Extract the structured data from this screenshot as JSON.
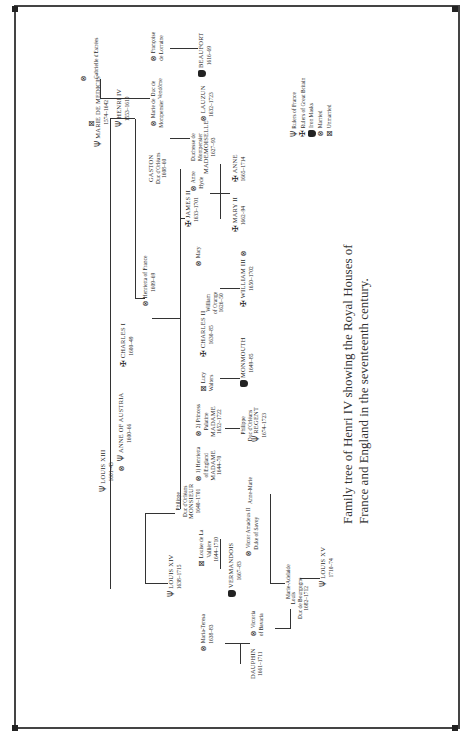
{
  "caption": {
    "line1": "Family tree of Henri IV showing the Royal Houses of",
    "line2": "France and England in the seventeenth century."
  },
  "legend": {
    "items": [
      {
        "icon": "fleur-icon",
        "label": "Rulers of France"
      },
      {
        "icon": "cross-icon",
        "label": "Rulers of Great Britain"
      },
      {
        "icon": "mask-icon",
        "label": "Iron Masks"
      },
      {
        "icon": "married-icon",
        "label": "Married"
      },
      {
        "icon": "unmarried-icon",
        "label": "Unmarried"
      }
    ]
  },
  "symbols": {
    "france": "Ψ",
    "britain": "✠",
    "married": "⊗",
    "unmarried": "⊠"
  },
  "people": {
    "marie_de_medicis": {
      "name": "MARIE DE MEDICIS",
      "dates": "1574–1642"
    },
    "henri_iv": {
      "name": "HENRI IV",
      "dates": "1553–1610"
    },
    "gabrielle": {
      "name": "Gabrielle d'Estrées"
    },
    "duc_de_vendome": {
      "name": "Duc de",
      "name2": "Vendôme"
    },
    "francoise": {
      "name": "Françoise",
      "name2": "de Lorraine"
    },
    "beaufort": {
      "name": "BEAUFORT",
      "dates": "1616–69"
    },
    "gaston": {
      "name": "GASTON",
      "title": "Duc d'Orléans",
      "dates": "1608–60"
    },
    "marie_montpensier": {
      "name": "Marie de",
      "name2": "Montpensier"
    },
    "duchesse_montpensier": {
      "name": "Duchesse de",
      "name2": "Montpensier",
      "title": "MADEMOISELLE",
      "dates": "1627–93"
    },
    "lauzun": {
      "name": "LAUZUN",
      "dates": "1632–1723"
    },
    "louis_xiii": {
      "name": "LOUIS XIII",
      "dates": "1601–43"
    },
    "anne_austria": {
      "name": "ANNE OF AUSTRIA",
      "dates": "1600–66"
    },
    "charles_i": {
      "name": "CHARLES I",
      "dates": "1600–49"
    },
    "henrietta_france": {
      "name": "Henrietta of France",
      "dates": "1609–69"
    },
    "james_ii": {
      "name": "JAMES II",
      "dates": "1633–1701"
    },
    "anne_hyde": {
      "name": "Anne",
      "name2": "Hyde"
    },
    "mary_ii": {
      "name": "MARY II",
      "dates": "1662–94"
    },
    "anne": {
      "name": "ANNE",
      "dates": "1665–1714"
    },
    "mary": {
      "name": "Mary"
    },
    "william_orange": {
      "name": "William",
      "name2": "of Orange",
      "dates": "1626–50"
    },
    "william_iii": {
      "name": "WILLIAM III",
      "dates": "1650–1702"
    },
    "charles_ii": {
      "name": "CHARLES II",
      "dates": "1630–85"
    },
    "lucy_walters": {
      "name": "Lucy",
      "name2": "Walters"
    },
    "monmouth": {
      "name": "MONMOUTH",
      "dates": "1649–85"
    },
    "henrietta_england": {
      "name": "1) Henrietta",
      "name2": "of England",
      "title": "MADAME",
      "dates": "1644–70"
    },
    "princess_palatine": {
      "name": "2) Princess",
      "name2": "Palatine",
      "title": "MADAME",
      "dates": "1652–1722"
    },
    "philippe_regent": {
      "name": "Philippe",
      "name2": "Duc d'Orléans",
      "title": "REGENT",
      "dates": "1674–1723"
    },
    "philippe_monsieur": {
      "name": "Philippe",
      "name2": "Duc d'Orléans",
      "title": "MONSIEUR",
      "dates": "1640–1701"
    },
    "anne_marie": {
      "name": "Anne-Marie"
    },
    "victor_amadeus": {
      "name": "Victor Amadeus II",
      "name2": "Duke of Savoy"
    },
    "marie_adelaide": {
      "name": "Marie-Adelaide"
    },
    "louis_xiv": {
      "name": "LOUIS XIV",
      "dates": "1638–1715"
    },
    "louise_la_valliere": {
      "name": "Louise de La",
      "name2": "Vallière",
      "dates": "1644–1710"
    },
    "vermandois": {
      "name": "VERMANDOIS",
      "dates": "1667–83"
    },
    "maria_teresa": {
      "name": "Maria-Teresa",
      "dates": "1638–83"
    },
    "dauphin": {
      "name": "DAUPHIN",
      "dates": "1661–1711"
    },
    "victoria_bavaria": {
      "name": "Victoria",
      "name2": "of Bavaria"
    },
    "louis_bourgogne": {
      "name": "Louis",
      "title": "Duc de Bourgogne",
      "dates": "1682–1712"
    },
    "louis_xv": {
      "name": "LOUIS XV",
      "dates": "1710–74"
    }
  }
}
